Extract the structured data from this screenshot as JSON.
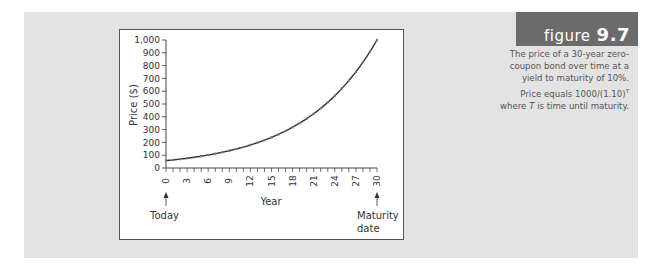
{
  "figure": {
    "word": "figure",
    "number": "9.7",
    "caption_parts": {
      "before_formula": "The price of a 30-year zero-coupon bond over time at a yield to maturity of 10%. Price equals 1000/(1.10)",
      "superscript": "T",
      "where": " where ",
      "var": "T",
      "after": " is time until maturity."
    },
    "header_color": "#6b6b6b",
    "panel_color": "#e3e3e3"
  },
  "chart_data": {
    "type": "line",
    "title": "",
    "xlabel": "Year",
    "ylabel": "Price ($)",
    "x": [
      0,
      3,
      6,
      9,
      12,
      15,
      18,
      21,
      24,
      27,
      30
    ],
    "series": [
      {
        "name": "Price of 30-year zero-coupon bond (YTM 10%)",
        "values": [
          57.3,
          76.3,
          101.5,
          135.1,
          179.9,
          239.4,
          318.6,
          424.1,
          564.5,
          751.3,
          1000
        ]
      }
    ],
    "xlim": [
      0,
      30
    ],
    "ylim": [
      0,
      1000
    ],
    "x_ticks": [
      "0",
      "3",
      "6",
      "9",
      "12",
      "15",
      "18",
      "21",
      "24",
      "27",
      "30"
    ],
    "y_ticks": [
      "0",
      "100",
      "200",
      "300",
      "400",
      "500",
      "600",
      "700",
      "800",
      "900",
      "1,000"
    ],
    "annotations": [
      {
        "x": 0,
        "label": "Today"
      },
      {
        "x": 30,
        "label": "Maturity date",
        "lines": [
          "Maturity",
          "date"
        ]
      }
    ],
    "grid": false,
    "legend": "none"
  }
}
